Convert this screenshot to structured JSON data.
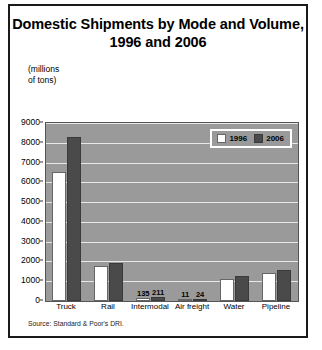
{
  "chart_data": {
    "type": "bar",
    "title": "Domestic Shipments by Mode and Volume, 1996 and 2006",
    "xlabel": "",
    "ylabel": "(millions\nof tons)",
    "ylim": [
      0,
      9000
    ],
    "yticks": [
      0,
      1000,
      2000,
      3000,
      4000,
      5000,
      6000,
      7000,
      8000,
      9000
    ],
    "ytick_labels": [
      "0",
      "1000",
      "2000",
      "3000",
      "4000",
      "5000",
      "6000",
      "7000",
      "8000",
      "9000"
    ],
    "grid": true,
    "legend_position": "top-right",
    "categories": [
      "Truck",
      "Rail",
      "Intermodal",
      "Air freight",
      "Water",
      "Pipeline"
    ],
    "series": [
      {
        "name": "1996",
        "color": "#ffffff",
        "values": [
          6500,
          1750,
          135,
          11,
          1100,
          1400
        ],
        "labels": [
          "",
          "",
          "135",
          "11",
          "",
          ""
        ]
      },
      {
        "name": "2006",
        "color": "#4a4a4a",
        "values": [
          8300,
          1900,
          211,
          24,
          1250,
          1580
        ],
        "labels": [
          "",
          "",
          "211",
          "24",
          "",
          ""
        ]
      }
    ],
    "annotations": [
      "135",
      "211",
      "11",
      "24"
    ],
    "source": "Source: Standard & Poor's DRI.",
    "plot_background": "#9a9a9a",
    "gridline_color": "#e8e8e8"
  }
}
